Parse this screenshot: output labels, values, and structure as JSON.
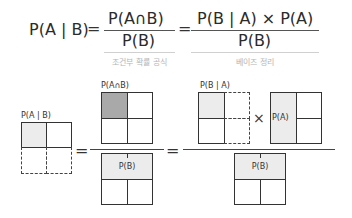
{
  "formula": {
    "lhs": "P(A | B)",
    "equals": "=",
    "frac1": {
      "numerator": "P(A∩B)",
      "denominator": "P(B)",
      "caption": "조건부 확률 공식"
    },
    "frac2": {
      "numerator": "P(B | A) × P(A)",
      "denominator": "P(B)",
      "caption": "베이즈 정리"
    }
  },
  "diagram": {
    "left_box_label": "P(A | B)",
    "mid_top_label": "P(A∩B)",
    "mid_bottom_label": "P(B)",
    "right_top_label_1": "P(B | A)",
    "right_top_cell_label": "P(A)",
    "times": "×",
    "right_bottom_label": "P(B)",
    "equals": "="
  },
  "colors": {
    "light_shade": "#ececec",
    "dark_shade": "#a9a9a9",
    "line": "#333333",
    "caption": "#b5b5b5"
  }
}
